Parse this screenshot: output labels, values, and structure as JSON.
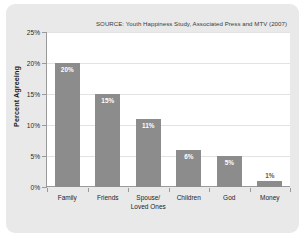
{
  "chart_data": {
    "type": "bar",
    "title": "",
    "subtitle": "",
    "source_note": "SOURCE: Youth Happiness Study, Associated Press and MTV (2007)",
    "categories": [
      "Family",
      "Friends",
      "Spouse/\nLoved Ones",
      "Children",
      "God",
      "Money"
    ],
    "category_lines": [
      [
        "Family"
      ],
      [
        "Friends"
      ],
      [
        "Spouse/",
        "Loved Ones"
      ],
      [
        "Children"
      ],
      [
        "God"
      ],
      [
        "Money"
      ]
    ],
    "values": [
      20,
      15,
      11,
      6,
      5,
      1
    ],
    "value_labels": [
      "20%",
      "15%",
      "11%",
      "6%",
      "5%",
      "1%"
    ],
    "xlabel": "",
    "ylabel": "Percent Agreeing",
    "ylim": [
      0,
      25
    ],
    "ytick_values": [
      0,
      5,
      10,
      15,
      20,
      25
    ],
    "ytick_labels": [
      "0%",
      "5%",
      "10%",
      "15%",
      "20%",
      "25%"
    ],
    "grid": true,
    "legend": "none",
    "bar_color": "#8c8c8c",
    "plot_background": "#ffffff",
    "panel_background": "#e9e9e9",
    "label_text_color": "#ffffff",
    "axis_color": "#9a9a9a",
    "gridline_color": "#e2e2e2"
  }
}
